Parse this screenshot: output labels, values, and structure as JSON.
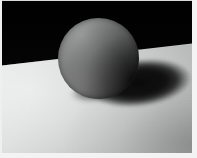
{
  "image": {
    "title": "Sphere on a plane",
    "subject": "matte gray sphere resting on a light gray surface",
    "width_px": 197,
    "height_px": 158,
    "scene_type": "still-life photograph / 3D render"
  },
  "scene": {
    "background": {
      "name": "dark backdrop",
      "color": "#000000",
      "region": "upper portion of frame"
    },
    "floor": {
      "name": "light gray ground plane",
      "base_color": "#d6d7d7",
      "highlight_color": "#eeefef",
      "shade_color": "#b0b1b1",
      "horizon_left_y": 63,
      "horizon_right_y": 39
    },
    "sphere": {
      "name": "sphere",
      "center_x": 97,
      "center_y": 58,
      "radius": 40,
      "lit_color": "#9a9b9b",
      "mid_color": "#6d6e6e",
      "shadow_color": "#0a0b0b",
      "light_direction": "upper-left"
    },
    "cast_shadow": {
      "name": "cast shadow",
      "color": "#050505",
      "center_x": 139,
      "center_y": 83,
      "width": 106,
      "height": 48,
      "rotation_deg": -7
    },
    "frame": {
      "name": "photo margin",
      "margin_color": "#f1f1f1",
      "left_px": 2,
      "right_px": 5,
      "top_px": 1,
      "bottom_px": 5
    }
  }
}
